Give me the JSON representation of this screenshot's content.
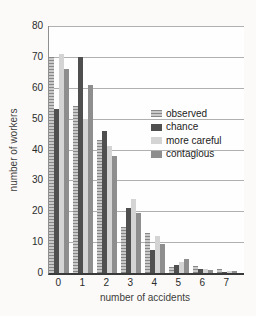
{
  "figure": {
    "background": "#f6f5f2",
    "plot_background": "#fefefe",
    "gridline_color": "#b0b0b0"
  },
  "chart_data": {
    "type": "bar",
    "title": "",
    "xlabel": "number of accidents",
    "ylabel": "number of workers",
    "categories": [
      "0",
      "1",
      "2",
      "3",
      "4",
      "5",
      "6",
      "7"
    ],
    "series": [
      {
        "name": "observed",
        "fill": "#c9c9c9",
        "stripe": "#878787",
        "hatch": true,
        "values": [
          70,
          54,
          43,
          15,
          13,
          1.8,
          2.4,
          1.2
        ]
      },
      {
        "name": "chance",
        "fill": "#4f4f4f",
        "stripe": "#4f4f4f",
        "hatch": false,
        "values": [
          53,
          70,
          46,
          21,
          7.5,
          2.5,
          1.3,
          0.4
        ]
      },
      {
        "name": "more careful",
        "fill": "#d4d4d4",
        "stripe": "#d4d4d4",
        "hatch": false,
        "values": [
          71,
          50,
          41,
          24,
          12,
          3.5,
          1.4,
          0.8
        ]
      },
      {
        "name": "contagious",
        "fill": "#8e8e8e",
        "stripe": "#8e8e8e",
        "hatch": false,
        "values": [
          66,
          61,
          38,
          19.5,
          9.5,
          4.5,
          0.9,
          0.5
        ]
      }
    ],
    "ylim": [
      0,
      80
    ],
    "yticks": [
      80,
      70,
      60,
      50,
      40,
      30,
      20,
      10,
      0
    ],
    "ytick_step": 10,
    "grid": "horizontal",
    "legend_position": "middle-right",
    "legend_labels": [
      "observed",
      "chance",
      "more careful",
      "contagious"
    ]
  }
}
